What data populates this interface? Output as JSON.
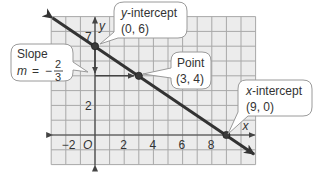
{
  "chart_data": {
    "type": "line",
    "title": "",
    "xlabel": "x",
    "ylabel": "y",
    "xlim": [
      -3,
      11
    ],
    "ylim": [
      -2,
      8
    ],
    "grid": true,
    "x_tick_labels": [
      "-2",
      "O",
      "2",
      "4",
      "6",
      "8"
    ],
    "x_tick_values": [
      -2,
      0,
      2,
      4,
      6,
      8
    ],
    "y_tick_labels": [
      "2",
      "7"
    ],
    "y_tick_values": [
      2,
      6.7
    ],
    "series": [
      {
        "name": "line",
        "equation": "y = -2/3 x + 6",
        "x": [
          -2.9,
          10.9
        ],
        "y": [
          7.9,
          -1.3
        ]
      }
    ],
    "points": [
      {
        "label": "y-intercept",
        "x": 0,
        "y": 6
      },
      {
        "label": "Point",
        "x": 3,
        "y": 4
      },
      {
        "label": "x-intercept",
        "x": 9,
        "y": 0
      }
    ],
    "slope_triangle": {
      "rise": -2,
      "run": 3,
      "from": [
        0,
        6
      ],
      "corner": [
        0,
        4
      ],
      "to": [
        3,
        4
      ]
    },
    "annotations": [
      {
        "text": "Slope m = -2/3"
      },
      {
        "text": "y-intercept (0, 6)"
      },
      {
        "text": "Point (3, 4)"
      },
      {
        "text": "x-intercept (9, 0)"
      }
    ]
  },
  "axes": {
    "x_label": "x",
    "y_label": "y",
    "origin_label": "O",
    "x_ticks": [
      {
        "value": -2,
        "label": "−2"
      },
      {
        "value": 2,
        "label": "2"
      },
      {
        "value": 4,
        "label": "4"
      },
      {
        "value": 6,
        "label": "6"
      },
      {
        "value": 8,
        "label": "8"
      }
    ],
    "y_ticks": [
      {
        "value": 2,
        "label": "2"
      },
      {
        "value": 6.7,
        "label": "7"
      }
    ]
  },
  "callouts": {
    "slope": {
      "title": "Slope",
      "m_label": "m",
      "equals": "=",
      "sign": "−",
      "numerator": "2",
      "denominator": "3"
    },
    "y_intercept": {
      "title": "y",
      "title_rest": "-intercept",
      "coords": "(0, 6)"
    },
    "point": {
      "title": "Point",
      "coords": "(3, 4)"
    },
    "x_intercept": {
      "title": "x",
      "title_rest": "-intercept",
      "coords": "(9, 0)"
    }
  },
  "colors": {
    "grid_bg": "#ececec",
    "grid_line": "#a8a8a8",
    "axis": "#444444",
    "line": "#333333",
    "point_fill": "#3a3a3a",
    "callout_border": "#9a9a9a",
    "callout_fill": "#ffffff"
  }
}
